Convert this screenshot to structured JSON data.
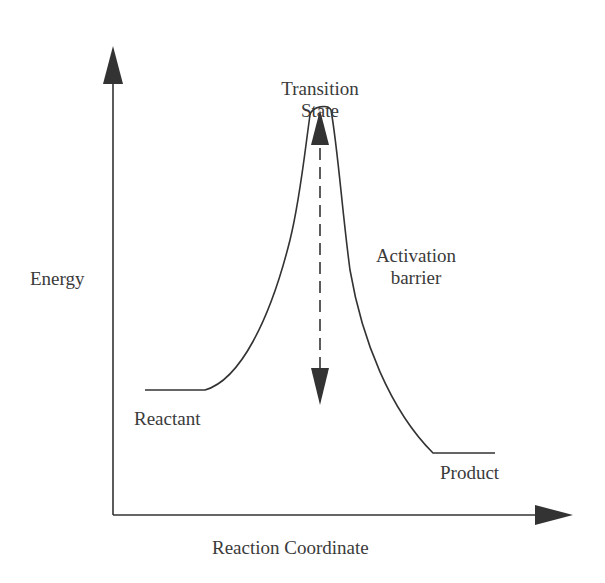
{
  "diagram": {
    "type": "energy-profile",
    "axes": {
      "y_label": "Energy",
      "x_label": "Reaction Coordinate"
    },
    "labels": {
      "transition_state_line1": "Transition",
      "transition_state_line2": "State",
      "activation_line1": "Activation",
      "activation_line2": "barrier",
      "reactant": "Reactant",
      "product": "Product"
    },
    "colors": {
      "line": "#333333",
      "text": "#3a3a3a",
      "background": "#ffffff"
    }
  }
}
